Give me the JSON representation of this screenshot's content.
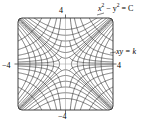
{
  "figure": {
    "background_color": "#ffffff",
    "curve_color": "#1a1a1a",
    "frame_color": "#2b2b2b",
    "axis_color": "#888888"
  },
  "labels": {
    "top_tick": "4",
    "bottom_tick": "−4",
    "left_tick": "−4",
    "right_tick": "4",
    "family_xy": "xy = k",
    "family_hyperbola_base": "x",
    "family_hyperbola_exp1": "2",
    "family_hyperbola_mid": " − y",
    "family_hyperbola_exp2": "2",
    "family_hyperbola_tail": " = C"
  },
  "chart_data": {
    "type": "line",
    "title": "",
    "xlabel": "",
    "ylabel": "",
    "xlim": [
      -4,
      4
    ],
    "ylim": [
      -4,
      4
    ],
    "xticks": [
      -4,
      4
    ],
    "yticks": [
      -4,
      4
    ],
    "xticklabels": [
      "−4",
      "4"
    ],
    "yticklabels": [
      "−4",
      "4"
    ],
    "grid": false,
    "legend": null,
    "annotations": [
      {
        "text": "x² − y² = C",
        "x": 4.2,
        "y": 4.6,
        "target_x": 2.6,
        "target_y": 3.4
      },
      {
        "text": "xy = k",
        "x": 4.3,
        "y": 1.3,
        "target_x": 3.6,
        "target_y": 1.05
      }
    ],
    "series": [
      {
        "name": "x^2 - y^2 = C",
        "equation": "x^2 - y^2 = C",
        "style": "solid",
        "constants": [
          -9,
          -6.25,
          -4,
          -2.25,
          -1,
          -0.25,
          0.25,
          1,
          2.25,
          4,
          6.25,
          9
        ]
      },
      {
        "name": "xy = k",
        "equation": "x*y = k",
        "style": "solid",
        "constants": [
          -8,
          -5,
          -3,
          -1.6,
          -0.7,
          -0.2,
          0.2,
          0.7,
          1.6,
          3,
          5,
          8
        ]
      }
    ]
  }
}
